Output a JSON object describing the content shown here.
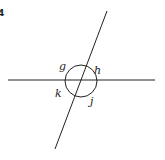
{
  "figure": {
    "number": "4",
    "angle_labels": {
      "top_left": "g",
      "top_right": "h",
      "bottom_left": "k",
      "bottom_right": "j"
    },
    "colors": {
      "line": "#222222",
      "background": "#ffffff"
    }
  }
}
